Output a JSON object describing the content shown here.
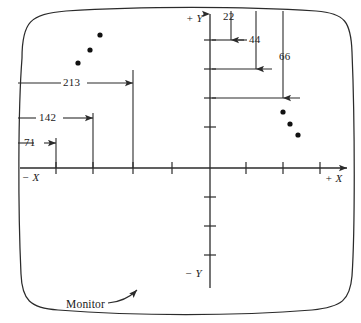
{
  "figure": {
    "stroke_color": "#2b2b2b",
    "dot_color": "#111111",
    "background": "#ffffff"
  },
  "axes": {
    "x_positive_label": "+ X",
    "x_negative_label": "− X",
    "y_positive_label": "+ Y",
    "y_negative_label": "− Y",
    "origin": {
      "x": 210,
      "y": 168
    },
    "x_ticks_left": [
      56,
      93,
      133,
      172
    ],
    "x_ticks_right": [
      246,
      283,
      320
    ],
    "y_ticks_up": [
      40,
      69,
      98,
      127
    ],
    "y_ticks_down": [
      197,
      226,
      255
    ]
  },
  "horizontal_dimensions": [
    {
      "value": "71",
      "y": 143,
      "from_x": 18,
      "to_x": 56,
      "label_x": 24,
      "label_y": 137
    },
    {
      "value": "142",
      "y": 118,
      "from_x": 18,
      "to_x": 93,
      "label_x": 39,
      "label_y": 112
    },
    {
      "value": "213",
      "y": 83,
      "from_x": 18,
      "to_x": 133,
      "label_x": 63,
      "label_y": 77
    }
  ],
  "vertical_dimensions": [
    {
      "value": "22",
      "x": 231,
      "from_y": 12,
      "to_y": 40,
      "label_x": 223,
      "label_y": 12
    },
    {
      "value": "44",
      "x": 256,
      "from_y": 12,
      "to_y": 69,
      "label_x": 242,
      "label_y": 36
    },
    {
      "value": "66",
      "x": 283,
      "from_y": 12,
      "to_y": 98,
      "label_x": 279,
      "label_y": 52
    }
  ],
  "reference_lines": [
    {
      "y": 40,
      "from_x": 212,
      "to_x": 244
    },
    {
      "y": 69,
      "from_x": 212,
      "to_x": 272
    },
    {
      "y": 98,
      "from_x": 212,
      "to_x": 300
    }
  ],
  "guide_lines": [
    {
      "x": 56,
      "from_y": 143,
      "to_y": 168
    },
    {
      "x": 93,
      "from_y": 113,
      "to_y": 168
    },
    {
      "x": 133,
      "from_y": 70,
      "to_y": 168
    }
  ],
  "dots_left": [
    {
      "x": 78,
      "y": 63
    },
    {
      "x": 90,
      "y": 50
    },
    {
      "x": 100,
      "y": 35
    }
  ],
  "dots_right": [
    {
      "x": 283,
      "y": 112
    },
    {
      "x": 290,
      "y": 124
    },
    {
      "x": 298,
      "y": 135
    }
  ],
  "callout": {
    "label": "Monitor",
    "label_x": 66,
    "label_y": 301
  }
}
